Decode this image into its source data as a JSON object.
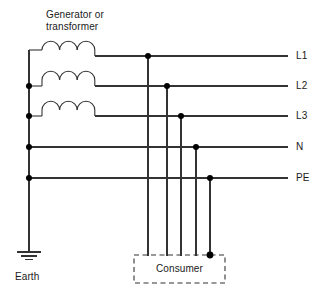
{
  "diagram": {
    "type": "electrical-schematic",
    "title_lines": [
      "Generator or",
      "transformer"
    ],
    "source_label": "Generator or transformer",
    "earth_label": "Earth",
    "consumer_label": "Consumer",
    "colors": {
      "line": "#333333",
      "node": "#000000",
      "text": "#1a1a1a",
      "background": "#ffffff",
      "dashed_box": "#333333"
    },
    "conductors": [
      {
        "id": "L1",
        "label": "L1",
        "y": 56,
        "has_coil": true,
        "coil_index": 1,
        "bus_dot": false,
        "tap_x": 148
      },
      {
        "id": "L2",
        "label": "L2",
        "y": 86,
        "has_coil": true,
        "coil_index": 2,
        "bus_dot": true,
        "tap_x": 167
      },
      {
        "id": "L3",
        "label": "L3",
        "y": 116,
        "has_coil": true,
        "coil_index": 3,
        "bus_dot": true,
        "tap_x": 181
      },
      {
        "id": "N",
        "label": "N",
        "y": 147,
        "has_coil": false,
        "coil_index": 0,
        "bus_dot": true,
        "tap_x": 196
      },
      {
        "id": "PE",
        "label": "PE",
        "y": 178,
        "has_coil": false,
        "coil_index": 0,
        "bus_dot": true,
        "tap_x": 210
      }
    ],
    "geometry": {
      "bus_x": 29,
      "line_right_x": 288,
      "label_x": 296,
      "coil_start_x": 42,
      "coil_end_x": 95,
      "coil_arcs": 3,
      "earth_y_top": 178,
      "earth_y_stem": 252,
      "consumer_box": {
        "x": 134,
        "y": 255,
        "w": 91,
        "h": 28
      },
      "pe_node_y": 255
    },
    "nodes": [
      {
        "name": "bus-node-L2",
        "x": 29,
        "y": 86
      },
      {
        "name": "bus-node-L3",
        "x": 29,
        "y": 116
      },
      {
        "name": "bus-node-N",
        "x": 29,
        "y": 147
      },
      {
        "name": "bus-node-PE",
        "x": 29,
        "y": 178
      },
      {
        "name": "tap-node-L1",
        "x": 148,
        "y": 56
      },
      {
        "name": "tap-node-L2",
        "x": 167,
        "y": 86
      },
      {
        "name": "tap-node-L3",
        "x": 181,
        "y": 116
      },
      {
        "name": "tap-node-N",
        "x": 196,
        "y": 147
      },
      {
        "name": "tap-node-PE",
        "x": 210,
        "y": 178
      },
      {
        "name": "consumer-pe-node",
        "x": 210,
        "y": 255
      }
    ]
  }
}
